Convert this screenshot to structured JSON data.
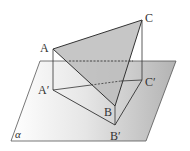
{
  "figure": {
    "plane": {
      "label": "α",
      "corners": [
        [
          40,
          61
        ],
        [
          176,
          61
        ],
        [
          146,
          141
        ],
        [
          11,
          141
        ]
      ],
      "fill_left": "#ffffff",
      "fill_right": "#b8b8b8"
    },
    "points": {
      "A": {
        "label": "A",
        "x": 53,
        "y": 49
      },
      "B": {
        "label": "B",
        "x": 115,
        "y": 106
      },
      "C": {
        "label": "C",
        "x": 142,
        "y": 20
      },
      "A1": {
        "label": "A′",
        "x": 53,
        "y": 90
      },
      "B1": {
        "label": "B′",
        "x": 115,
        "y": 125
      },
      "C1": {
        "label": "C′",
        "x": 142,
        "y": 80
      }
    },
    "triangle_fill": "#bdbdbd",
    "line_color": "#333333",
    "edges_solid": [
      "AC",
      "AB",
      "BC",
      "A'B'",
      "B'C'",
      "AA'",
      "BB'",
      "CC'"
    ],
    "edges_dashed": [
      "A'C' (hidden part)",
      "AC projection line on plane edge"
    ]
  }
}
